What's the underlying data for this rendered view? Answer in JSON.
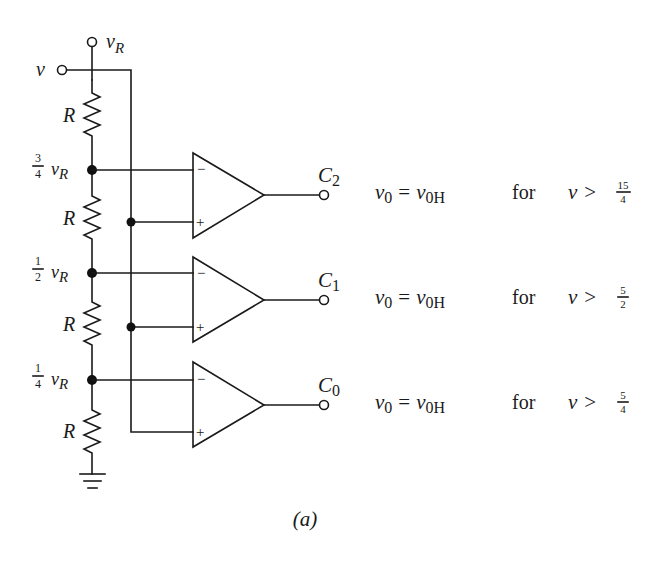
{
  "figure": {
    "caption": "(a)",
    "inputs": {
      "reference": {
        "symbol": "v",
        "subscript": "R"
      },
      "signal": {
        "symbol": "v"
      }
    },
    "resistor_label": "R",
    "resistors": [
      {
        "label": "R",
        "y_top": 80,
        "y_bot": 153
      },
      {
        "label": "R",
        "y_top": 170,
        "y_bot": 273
      },
      {
        "label": "R",
        "y_top": 273,
        "y_bot": 380
      },
      {
        "label": "R",
        "y_top": 380,
        "y_bot": 474
      }
    ],
    "taps": [
      {
        "fraction_num": "3",
        "fraction_den": "4",
        "symbol": "v",
        "subscript": "R",
        "y": 170
      },
      {
        "fraction_num": "1",
        "fraction_den": "2",
        "symbol": "v",
        "subscript": "R",
        "y": 273
      },
      {
        "fraction_num": "1",
        "fraction_den": "4",
        "symbol": "v",
        "subscript": "R",
        "y": 380
      }
    ],
    "comparators": [
      {
        "output_label": "C",
        "output_sub": "2",
        "minus_sign": "−",
        "plus_sign": "+",
        "top": 153,
        "bottom": 238,
        "condition": {
          "lhs": "v",
          "lhs_sub": "0",
          "eq": "=",
          "rhs": "v",
          "rhs_sub": "0H",
          "word": "for",
          "var": "v",
          "op": ">",
          "num": "15",
          "den": "4"
        }
      },
      {
        "output_label": "C",
        "output_sub": "1",
        "minus_sign": "−",
        "plus_sign": "+",
        "top": 257,
        "bottom": 342,
        "condition": {
          "lhs": "v",
          "lhs_sub": "0",
          "eq": "=",
          "rhs": "v",
          "rhs_sub": "0H",
          "word": "for",
          "var": "v",
          "op": ">",
          "num": "5",
          "den": "2"
        }
      },
      {
        "output_label": "C",
        "output_sub": "0",
        "minus_sign": "−",
        "plus_sign": "+",
        "top": 362,
        "bottom": 447,
        "condition": {
          "lhs": "v",
          "lhs_sub": "0",
          "eq": "=",
          "rhs": "v",
          "rhs_sub": "0H",
          "word": "for",
          "var": "v",
          "op": ">",
          "num": "5",
          "den": "4"
        }
      }
    ],
    "colors": {
      "ink": "#1a1a1a",
      "background": "#ffffff"
    }
  }
}
